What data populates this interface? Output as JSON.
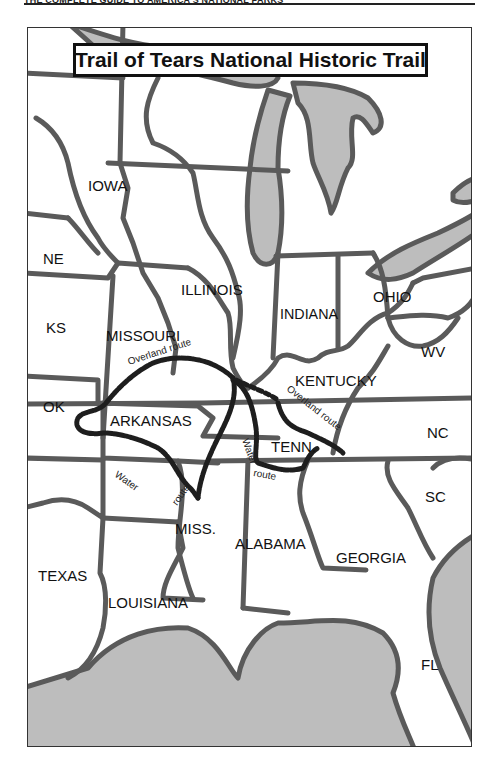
{
  "page": {
    "running_head": "THE COMPLETE GUIDE TO AMERICA'S NATIONAL PARKS"
  },
  "map": {
    "title": "Trail of Tears National Historic Trail",
    "colors": {
      "land": "#ffffff",
      "water": "#bdbdbd",
      "borders": "#5a5a5a",
      "trail": "#1e1e1e"
    },
    "states": {
      "iowa": "IOWA",
      "ne": "NE",
      "ks": "KS",
      "ok": "OK",
      "missouri": "MISSOURI",
      "illinois": "ILLINOIS",
      "indiana": "INDIANA",
      "ohio": "OHIO",
      "wv": "WV",
      "kentucky": "KENTUCKY",
      "arkansas": "ARKANSAS",
      "tenn": "TENN.",
      "nc": "NC",
      "sc": "SC",
      "miss": "MISS.",
      "alabama": "ALABAMA",
      "georgia": "GEORGIA",
      "texas": "TEXAS",
      "louisiana": "LOUISIANA",
      "fl": "FL"
    },
    "routes": {
      "overland_west": "Overland route",
      "overland_east": "Overland route",
      "water_arkansas_a": "Water",
      "water_arkansas_b": "route",
      "water_tenn_a": "Water",
      "water_tenn_b": "route"
    }
  }
}
